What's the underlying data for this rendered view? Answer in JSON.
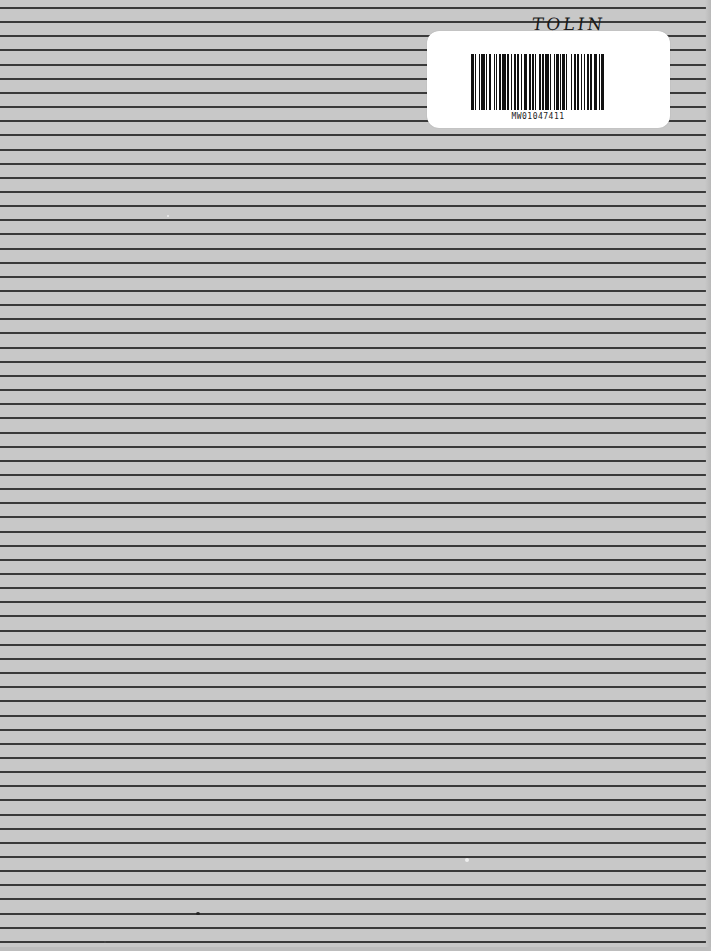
{
  "document": {
    "type": "ruled notebook cover",
    "background_color": "#c8c8c8",
    "rule_color": "#3a3a3a",
    "rules": {
      "first_y": 7,
      "spacing": 14.15,
      "count": 67
    }
  },
  "handwriting": {
    "text": "TOLIN"
  },
  "label": {
    "barcode_id": "MW01047411",
    "background_color": "#ffffff"
  },
  "barcode_pattern": [
    2,
    1,
    1,
    2,
    1,
    1,
    3,
    1,
    1,
    1,
    2,
    2,
    1,
    1,
    1,
    1,
    2,
    1,
    3,
    1,
    1,
    2,
    1,
    1,
    2,
    1,
    1,
    2,
    1,
    1,
    3,
    1,
    2,
    1,
    1,
    1,
    1,
    2,
    2,
    1,
    1,
    1,
    3,
    1,
    1,
    2,
    1,
    1,
    2,
    1,
    1,
    1,
    2,
    1,
    1,
    3,
    1,
    1,
    2,
    1,
    1,
    2,
    1,
    1,
    1,
    2,
    1,
    1,
    2,
    1,
    3,
    1,
    1,
    1,
    2
  ]
}
